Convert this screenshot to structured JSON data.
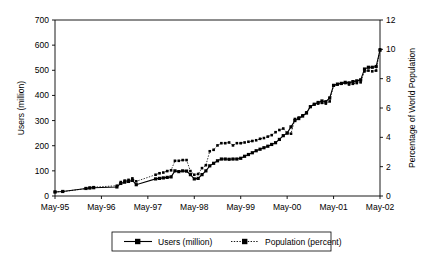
{
  "chart_data": {
    "type": "line",
    "title": "",
    "xlabel": "",
    "ylabel": "Users (million)",
    "y2label": "Percentage of  World Population",
    "xlim": [
      0,
      84
    ],
    "ylim": [
      0,
      700
    ],
    "y2lim": [
      0,
      12
    ],
    "grid": false,
    "legend_position": "bottom-center",
    "x_tick_labels": [
      "May-95",
      "May-96",
      "May-97",
      "May-98",
      "May-99",
      "May-00",
      "May-01",
      "May-02"
    ],
    "x_tick_values": [
      0,
      12,
      24,
      36,
      48,
      60,
      72,
      84
    ],
    "y_tick_labels": [
      "0",
      "100",
      "200",
      "300",
      "400",
      "500",
      "600",
      "700"
    ],
    "y_tick_values": [
      0,
      100,
      200,
      300,
      400,
      500,
      600,
      700
    ],
    "y2_tick_labels": [
      "0",
      "2",
      "4",
      "6",
      "8",
      "10",
      "12"
    ],
    "y2_tick_values": [
      0,
      2,
      4,
      6,
      8,
      10,
      12
    ],
    "series": [
      {
        "name": "Users (million)",
        "axis": "left",
        "style": "solid",
        "marker": "square",
        "x": [
          0,
          2,
          8,
          9,
          10,
          16,
          17,
          18,
          19,
          20,
          21,
          26,
          27,
          28,
          29,
          30,
          31,
          32,
          33,
          34,
          35,
          36,
          37,
          38,
          39,
          40,
          41,
          42,
          43,
          44,
          45,
          46,
          47,
          48,
          49,
          50,
          51,
          52,
          53,
          54,
          55,
          56,
          57,
          58,
          59,
          60,
          61,
          62,
          63,
          64,
          65,
          66,
          67,
          68,
          69,
          70,
          71,
          72,
          73,
          74,
          75,
          76,
          77,
          78,
          79,
          80,
          81,
          82,
          83,
          84
        ],
        "y": [
          16,
          18,
          30,
          32,
          33,
          36,
          50,
          55,
          58,
          62,
          45,
          68,
          70,
          72,
          74,
          76,
          100,
          97,
          100,
          99,
          85,
          68,
          70,
          85,
          100,
          120,
          130,
          140,
          147,
          147,
          146,
          147,
          147,
          150,
          158,
          165,
          172,
          180,
          186,
          192,
          198,
          205,
          212,
          225,
          240,
          250,
          275,
          300,
          308,
          318,
          330,
          355,
          365,
          372,
          378,
          375,
          390,
          440,
          445,
          448,
          452,
          450,
          455,
          458,
          462,
          505,
          512,
          512,
          515,
          580
        ],
        "y_final": 580
      },
      {
        "name": "Population (percent)",
        "axis": "right",
        "style": "dotted",
        "marker": "square",
        "x": [
          0,
          2,
          8,
          9,
          10,
          16,
          17,
          18,
          19,
          20,
          21,
          26,
          27,
          28,
          29,
          30,
          31,
          32,
          33,
          34,
          35,
          36,
          37,
          38,
          39,
          40,
          41,
          42,
          43,
          44,
          45,
          46,
          47,
          48,
          49,
          50,
          51,
          52,
          53,
          54,
          55,
          56,
          57,
          58,
          59,
          60,
          61,
          62,
          63,
          64,
          65,
          66,
          67,
          68,
          69,
          70,
          71,
          72,
          73,
          74,
          75,
          76,
          77,
          78,
          79,
          80,
          81,
          82,
          83,
          84
        ],
        "y": [
          0.28,
          0.3,
          0.5,
          0.55,
          0.6,
          0.7,
          0.95,
          1.05,
          1.1,
          1.2,
          1.0,
          1.45,
          1.55,
          1.6,
          1.7,
          1.75,
          2.4,
          2.4,
          2.45,
          2.45,
          1.7,
          1.45,
          1.5,
          1.9,
          2.1,
          3.05,
          3.15,
          3.45,
          3.6,
          3.6,
          3.65,
          3.45,
          3.6,
          3.6,
          3.65,
          3.7,
          3.75,
          3.8,
          3.9,
          3.95,
          4.05,
          4.15,
          4.35,
          4.5,
          4.6,
          4.3,
          4.25,
          5.25,
          5.35,
          5.5,
          5.7,
          6.1,
          6.25,
          6.3,
          6.35,
          6.3,
          6.45,
          7.55,
          7.6,
          7.65,
          7.7,
          7.6,
          7.65,
          7.7,
          7.75,
          8.5,
          8.55,
          8.5,
          8.55,
          10.0
        ],
        "y_final": 10.0
      }
    ]
  },
  "legend": {
    "entries": [
      {
        "label": "Users (million)",
        "style": "solid",
        "marker": "square"
      },
      {
        "label": "Population (percent)",
        "style": "dotted",
        "marker": "square"
      }
    ]
  },
  "axes": {
    "left_title": "Users (million)",
    "right_title": "Percentage of  World Population"
  }
}
